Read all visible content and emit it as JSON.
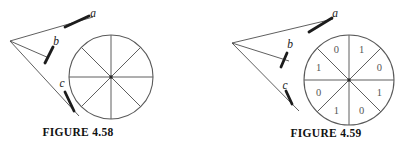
{
  "page_background": "#ffffff",
  "colors": {
    "thin_line": "#4d4d4d",
    "circle_line": "#5a5a5a",
    "arrowhead": "#1c1c1c",
    "center_dot": "#2a2a2a",
    "digit": "#555555",
    "arrow_label": "#1a1a1a",
    "caption": "#111111"
  },
  "figures": [
    {
      "caption": "FIGURE 4.58",
      "description": "circle divided into 8 equal sectors with external point and three arrows",
      "arrows": [
        {
          "label": "a"
        },
        {
          "label": "b"
        },
        {
          "label": "c"
        }
      ],
      "sector_count": 8,
      "sector_values_cw_from_top_right": []
    },
    {
      "caption": "FIGURE 4.59",
      "description": "circle divided into 8 equal sectors containing alternating binary digits, with external point and three arrows",
      "arrows": [
        {
          "label": "a"
        },
        {
          "label": "b"
        },
        {
          "label": "c"
        }
      ],
      "sector_count": 8,
      "sector_values_cw_from_top_right": [
        "1",
        "0",
        "1",
        "0",
        "1",
        "0",
        "1",
        "0"
      ]
    }
  ]
}
